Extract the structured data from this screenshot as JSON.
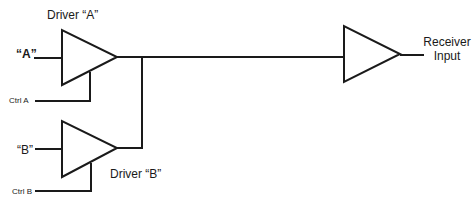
{
  "diagram": {
    "stroke_color": "#1a1a1a",
    "background": "#ffffff",
    "labels": {
      "driver_a": "Driver “A”",
      "driver_b": "Driver “B”",
      "input_a": "“A”",
      "input_b": "“B”",
      "ctrl_a": "Ctrl A",
      "ctrl_b": "Ctrl B",
      "receiver_line1": "Receiver",
      "receiver_line2": "Input"
    },
    "nodes": [
      {
        "id": "driver-a",
        "type": "tri-state-buffer",
        "label": "Driver “A”",
        "input": "“A”",
        "enable": "Ctrl A"
      },
      {
        "id": "driver-b",
        "type": "tri-state-buffer",
        "label": "Driver “B”",
        "input": "“B”",
        "enable": "Ctrl B"
      },
      {
        "id": "receiver",
        "type": "buffer",
        "label": "Receiver Input"
      }
    ],
    "edges": [
      {
        "from": "driver-a",
        "to": "receiver"
      },
      {
        "from": "driver-b",
        "to": "receiver"
      }
    ]
  }
}
